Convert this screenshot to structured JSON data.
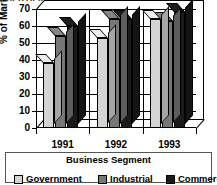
{
  "chart_data": {
    "type": "bar",
    "title": "CERTIFIED MARKET",
    "xlabel": "Business Segment",
    "ylabel": "% of Market",
    "categories": [
      "1991",
      "1992",
      "1993"
    ],
    "series": [
      {
        "name": "Government",
        "color": "#d4d4d4",
        "values": [
          38,
          53,
          64
        ]
      },
      {
        "name": "Industrial",
        "color": "#777777",
        "values": [
          54,
          64,
          63
        ]
      },
      {
        "name": "Commercial",
        "color": "#1a1a1a",
        "values": [
          60,
          64,
          68
        ]
      }
    ],
    "ylim": [
      0,
      70
    ],
    "yticks": [
      0,
      10,
      20,
      30,
      40,
      50,
      60,
      70
    ],
    "grid": true,
    "legend_position": "bottom",
    "legend_title": "Business Segment",
    "style": "3d-column"
  },
  "axis": {
    "y_title": "% of Market",
    "y_ticks": [
      "0",
      "10",
      "20",
      "30",
      "40",
      "50",
      "60",
      "70"
    ]
  },
  "x_labels": [
    "1991",
    "1992",
    "1993"
  ],
  "legend": {
    "title": "Business Segment",
    "items": [
      {
        "label": "Government",
        "color": "#d4d4d4"
      },
      {
        "label": "Industrial",
        "color": "#777777"
      },
      {
        "label": "Commercial",
        "color": "#1a1a1a"
      }
    ]
  },
  "title": "CERTIFIED MARKET"
}
